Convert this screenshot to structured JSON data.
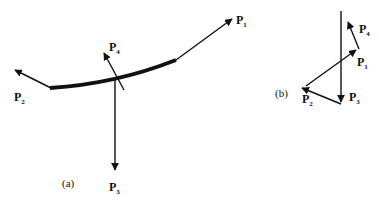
{
  "figure": {
    "panel_a": {
      "caption": "(a)",
      "labels": {
        "p1": {
          "base": "P",
          "sub": "1"
        },
        "p2": {
          "base": "P",
          "sub": "2"
        },
        "p3": {
          "base": "P",
          "sub": "3"
        },
        "p4": {
          "base": "P",
          "sub": "4"
        }
      }
    },
    "panel_b": {
      "caption": "(b)",
      "labels": {
        "p1": {
          "base": "P",
          "sub": "1"
        },
        "p2": {
          "base": "P",
          "sub": "2"
        },
        "p3": {
          "base": "P",
          "sub": "3"
        },
        "p4": {
          "base": "P",
          "sub": "4"
        }
      }
    },
    "colors": {
      "stroke": "#111111",
      "background": "#ffffff"
    }
  }
}
